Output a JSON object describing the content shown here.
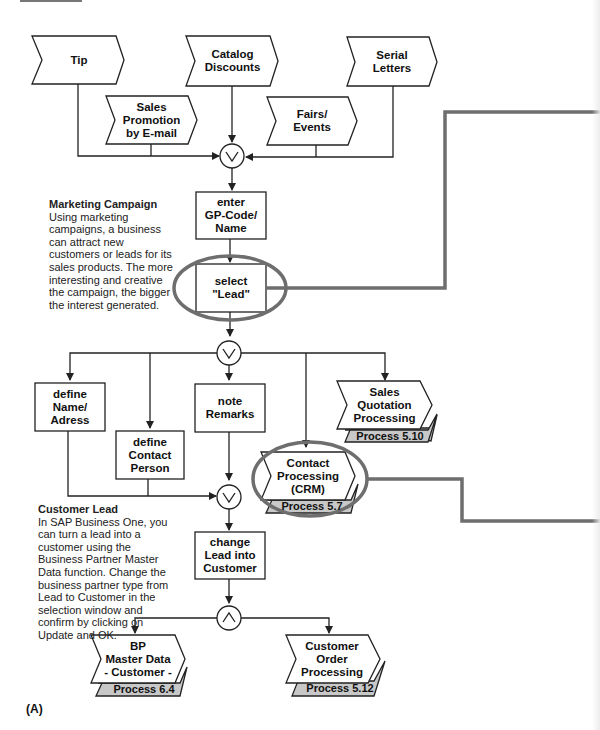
{
  "diagram": {
    "figure_label": "(A)",
    "events": [
      {
        "id": "tip",
        "label": "Tip"
      },
      {
        "id": "catalog",
        "label": "Catalog\nDiscounts"
      },
      {
        "id": "serial",
        "label": "Serial\nLetters"
      },
      {
        "id": "sales-promo",
        "label": "Sales\nPromotion\nby E-mail"
      },
      {
        "id": "fairs",
        "label": "Fairs/\nEvents"
      }
    ],
    "functions": [
      {
        "id": "enter-gp",
        "label": "enter\nGP-Code/\nName"
      },
      {
        "id": "select-lead",
        "label": "select\n\"Lead\""
      },
      {
        "id": "define-name",
        "label": "define\nName/\nAdress"
      },
      {
        "id": "define-contact",
        "label": "define\nContact\nPerson"
      },
      {
        "id": "note-remarks",
        "label": "note\nRemarks"
      },
      {
        "id": "change-lead",
        "label": "change\nLead into\nCustomer"
      }
    ],
    "process_links": [
      {
        "id": "sales-quotation",
        "label": "Sales\nQuotation\nProcessing",
        "process": "Process 5.10"
      },
      {
        "id": "contact-processing",
        "label": "Contact\nProcessing\n(CRM)",
        "process": "Process 5.7"
      },
      {
        "id": "bp-master",
        "label": "BP\nMaster Data\n- Customer -",
        "process": "Process 6.4"
      },
      {
        "id": "customer-order",
        "label": "Customer\nOrder\nProcessing",
        "process": "Process 5.12"
      }
    ],
    "connectors": [
      {
        "id": "or-1",
        "symbol": "∨",
        "type": "OR"
      },
      {
        "id": "or-2",
        "symbol": "∨",
        "type": "OR"
      },
      {
        "id": "or-3",
        "symbol": "∨",
        "type": "OR"
      },
      {
        "id": "and-1",
        "symbol": "∧",
        "type": "AND"
      }
    ],
    "notes": {
      "marketing": {
        "title": "Marketing Campaign",
        "text": "Using marketing campaigns, a business can attract new customers or leads for its sales products. The more interesting and creative the campaign, the bigger the interest generated."
      },
      "customer_lead": {
        "title": "Customer Lead",
        "text": "In SAP Business One, you can turn a lead into a customer using the Business Partner Master Data function. Change the business partner type from Lead to Customer in the selection window and confirm by clicking on Update and OK."
      }
    },
    "colors": {
      "line": "#222222",
      "highlight": "#6e6e6e",
      "process_tab": "#c8c8c8"
    }
  }
}
